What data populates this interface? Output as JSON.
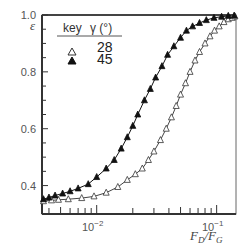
{
  "chart_data": {
    "type": "scatter",
    "title": "",
    "xlabel": "F_D/F_G",
    "ylabel": "ε",
    "xscale": "log",
    "xlim": [
      0.0035,
      0.145
    ],
    "ylim": [
      0.3,
      1.0
    ],
    "x_ticks": [
      {
        "value": 0.01,
        "label": "10",
        "exp": "−2"
      },
      {
        "value": 0.1,
        "label": "10",
        "exp": "−1"
      }
    ],
    "y_ticks": [
      {
        "value": 0.4,
        "label": "0.4"
      },
      {
        "value": 0.6,
        "label": "0.6"
      },
      {
        "value": 0.8,
        "label": "0.8"
      },
      {
        "value": 1.0,
        "label": "1.0"
      }
    ],
    "grid": false,
    "legend": {
      "position": "upper-left",
      "header_key": "key",
      "header_value": "γ (°)",
      "entries": [
        {
          "marker": "open-triangle",
          "value": "28"
        },
        {
          "marker": "filled-triangle",
          "value": "45"
        }
      ]
    },
    "series": [
      {
        "name": "γ = 28°",
        "marker": "open-triangle",
        "x": [
          0.0036,
          0.0042,
          0.0048,
          0.0058,
          0.0075,
          0.0095,
          0.012,
          0.015,
          0.018,
          0.021,
          0.024,
          0.027,
          0.03,
          0.034,
          0.038,
          0.042,
          0.046,
          0.05,
          0.055,
          0.06,
          0.066,
          0.072,
          0.08,
          0.088,
          0.096,
          0.105,
          0.115,
          0.125,
          0.135,
          0.142
        ],
        "y": [
          0.345,
          0.348,
          0.35,
          0.352,
          0.356,
          0.362,
          0.375,
          0.395,
          0.42,
          0.44,
          0.46,
          0.49,
          0.52,
          0.56,
          0.6,
          0.64,
          0.68,
          0.72,
          0.76,
          0.8,
          0.84,
          0.87,
          0.9,
          0.925,
          0.945,
          0.96,
          0.975,
          0.985,
          0.99,
          0.995
        ]
      },
      {
        "name": "γ = 45°",
        "marker": "filled-triangle",
        "x": [
          0.0036,
          0.004,
          0.0045,
          0.0052,
          0.006,
          0.007,
          0.0085,
          0.01,
          0.012,
          0.014,
          0.016,
          0.018,
          0.02,
          0.022,
          0.025,
          0.028,
          0.031,
          0.035,
          0.039,
          0.044,
          0.05,
          0.056,
          0.063,
          0.072,
          0.082,
          0.095,
          0.11,
          0.125,
          0.14
        ],
        "y": [
          0.352,
          0.358,
          0.365,
          0.372,
          0.38,
          0.39,
          0.405,
          0.43,
          0.46,
          0.49,
          0.53,
          0.57,
          0.61,
          0.65,
          0.7,
          0.74,
          0.78,
          0.82,
          0.86,
          0.89,
          0.92,
          0.945,
          0.96,
          0.972,
          0.982,
          0.99,
          0.994,
          0.997,
          0.998
        ]
      }
    ]
  }
}
